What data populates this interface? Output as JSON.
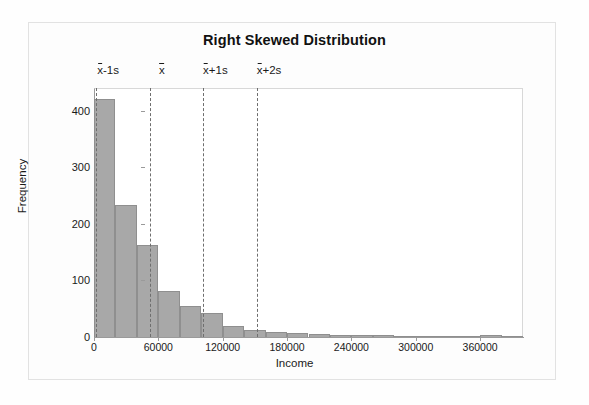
{
  "chart_data": {
    "type": "bar",
    "title": "Right Skewed Distribution",
    "xlabel": "Income",
    "ylabel": "Frequency",
    "xlim": [
      0,
      400000
    ],
    "ylim": [
      0,
      440
    ],
    "grid": false,
    "legend": null,
    "bin_width": 20000,
    "x": [
      10000,
      30000,
      50000,
      70000,
      90000,
      110000,
      130000,
      150000,
      170000,
      190000,
      210000,
      230000,
      250000,
      270000,
      290000,
      310000,
      330000,
      350000,
      370000,
      390000
    ],
    "values": [
      420,
      233,
      162,
      82,
      55,
      42,
      20,
      13,
      9,
      7,
      5,
      4,
      3,
      3,
      2,
      2,
      2,
      1,
      3,
      1
    ],
    "xticks": [
      0,
      60000,
      120000,
      180000,
      240000,
      300000,
      360000
    ],
    "xtick_labels": [
      "0",
      "60000",
      "120000",
      "180000",
      "240000",
      "300000",
      "360000"
    ],
    "yticks": [
      0,
      100,
      200,
      300,
      400
    ],
    "ytick_labels": [
      "0",
      "100",
      "200",
      "300",
      "400"
    ],
    "annotations": [
      {
        "name": "mean-minus-1s",
        "x": 2000,
        "label_prefix": "x",
        "label_suffix": "-1s"
      },
      {
        "name": "mean",
        "x": 52000,
        "label_prefix": "x",
        "label_suffix": ""
      },
      {
        "name": "mean-plus-1s",
        "x": 102000,
        "label_prefix": "x",
        "label_suffix": "+1s"
      },
      {
        "name": "mean-plus-2s",
        "x": 152000,
        "label_prefix": "x",
        "label_suffix": "+2s"
      }
    ],
    "colors": {
      "bar_fill": "#a8a8a8",
      "bar_edge": "#8f8f8f",
      "axis": "#9a9a9a",
      "annotation_line": "#6e6e6e",
      "text": "#1a1a1a",
      "frame": "#e2e2e2",
      "background": "#fefefe"
    }
  }
}
